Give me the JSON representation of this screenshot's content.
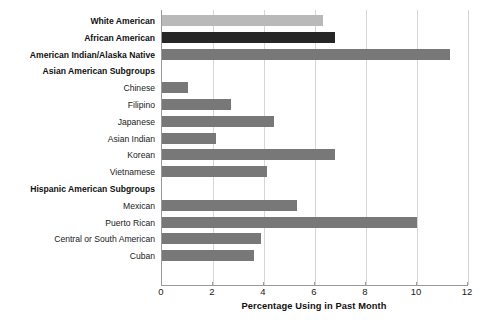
{
  "chart_data": {
    "type": "bar",
    "orientation": "horizontal",
    "title": "",
    "xlabel": "Percentage Using in Past Month",
    "ylabel": "",
    "xlim": [
      0,
      12
    ],
    "xticks": [
      0,
      2,
      4,
      6,
      8,
      10,
      12
    ],
    "grid": true,
    "legend": "none",
    "categories": [
      "White American",
      "African American",
      "American Indian/Alaska Native",
      "Asian American Subgroups",
      "Chinese",
      "Filipino",
      "Japanese",
      "Asian Indian",
      "Korean",
      "Vietnamese",
      "Hispanic American Subgroups",
      "Mexican",
      "Puerto Rican",
      "Central or South American",
      "Cuban"
    ],
    "values": [
      6.3,
      6.8,
      11.3,
      null,
      1.0,
      2.7,
      4.4,
      2.1,
      6.8,
      4.1,
      null,
      5.3,
      10.0,
      3.9,
      3.6
    ],
    "rows": [
      {
        "label": "White American",
        "value": 6.3,
        "bold": true,
        "header": false,
        "color": "#b9b9b9"
      },
      {
        "label": "African American",
        "value": 6.8,
        "bold": true,
        "header": false,
        "color": "#262626"
      },
      {
        "label": "American Indian/Alaska Native",
        "value": 11.3,
        "bold": true,
        "header": false,
        "color": "#787878"
      },
      {
        "label": "Asian American Subgroups",
        "value": null,
        "bold": true,
        "header": true,
        "color": ""
      },
      {
        "label": "Chinese",
        "value": 1.0,
        "bold": false,
        "header": false,
        "color": "#787878"
      },
      {
        "label": "Filipino",
        "value": 2.7,
        "bold": false,
        "header": false,
        "color": "#787878"
      },
      {
        "label": "Japanese",
        "value": 4.4,
        "bold": false,
        "header": false,
        "color": "#787878"
      },
      {
        "label": "Asian Indian",
        "value": 2.1,
        "bold": false,
        "header": false,
        "color": "#787878"
      },
      {
        "label": "Korean",
        "value": 6.8,
        "bold": false,
        "header": false,
        "color": "#787878"
      },
      {
        "label": "Vietnamese",
        "value": 4.1,
        "bold": false,
        "header": false,
        "color": "#787878"
      },
      {
        "label": "Hispanic American Subgroups",
        "value": null,
        "bold": true,
        "header": true,
        "color": ""
      },
      {
        "label": "Mexican",
        "value": 5.3,
        "bold": false,
        "header": false,
        "color": "#787878"
      },
      {
        "label": "Puerto Rican",
        "value": 10.0,
        "bold": false,
        "header": false,
        "color": "#787878"
      },
      {
        "label": "Central or South American",
        "value": 3.9,
        "bold": false,
        "header": false,
        "color": "#787878"
      },
      {
        "label": "Cuban",
        "value": 3.6,
        "bold": false,
        "header": false,
        "color": "#787878"
      }
    ],
    "colors": {
      "bar_light": "#b9b9b9",
      "bar_dark": "#262626",
      "bar_medium": "#787878",
      "gridline": "#d5d5d5",
      "axis": "#9a9a9a",
      "text": "#1a1a1a",
      "background": "#ffffff"
    }
  }
}
